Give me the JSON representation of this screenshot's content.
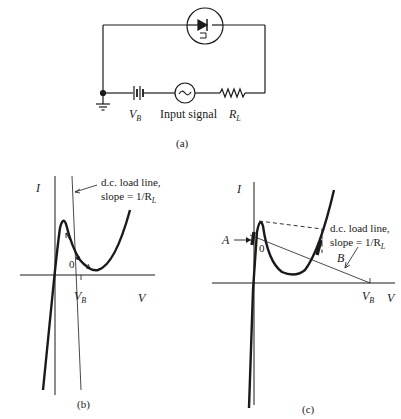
{
  "figure": {
    "panel_a": {
      "caption": "(a)",
      "components": {
        "diode_device": "tunnel-diode",
        "battery_label": "V",
        "battery_sub": "B",
        "source_label": "Input signal",
        "resistor_label": "R",
        "resistor_sub": "L",
        "ground": "ground"
      }
    },
    "panel_b": {
      "caption": "(b)",
      "y_axis_label": "I",
      "x_axis_label": "V",
      "vb_label": "V",
      "vb_sub": "B",
      "operating_point": "0",
      "load_line_text_1": "d.c. load line,",
      "load_line_text_2": "slope = 1/R",
      "load_line_sub": "L"
    },
    "panel_c": {
      "caption": "(c)",
      "y_axis_label": "I",
      "x_axis_label": "V",
      "vb_label": "V",
      "vb_sub": "B",
      "operating_point": "0",
      "point_a": "A",
      "point_b": "B",
      "load_line_text_1": "d.c. load line,",
      "load_line_text_2": "slope = 1/R",
      "load_line_sub": "L"
    },
    "colors": {
      "ink": "#1a1a1a",
      "background": "#ffffff"
    }
  }
}
